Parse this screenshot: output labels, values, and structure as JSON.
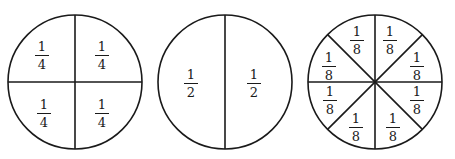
{
  "colors": {
    "stroke": "#1a1a1a",
    "background": "#ffffff"
  },
  "circles": [
    {
      "name": "quarters",
      "divisions": 4,
      "labels": [
        {
          "num": "1",
          "den": "4"
        },
        {
          "num": "1",
          "den": "4"
        },
        {
          "num": "1",
          "den": "4"
        },
        {
          "num": "1",
          "den": "4"
        }
      ]
    },
    {
      "name": "halves",
      "divisions": 2,
      "labels": [
        {
          "num": "1",
          "den": "2"
        },
        {
          "num": "1",
          "den": "2"
        }
      ]
    },
    {
      "name": "eighths",
      "divisions": 8,
      "labels": [
        {
          "num": "1",
          "den": "8"
        },
        {
          "num": "1",
          "den": "8"
        },
        {
          "num": "1",
          "den": "8"
        },
        {
          "num": "1",
          "den": "8"
        },
        {
          "num": "1",
          "den": "8"
        },
        {
          "num": "1",
          "den": "8"
        },
        {
          "num": "1",
          "den": "8"
        },
        {
          "num": "1",
          "den": "8"
        }
      ]
    }
  ]
}
